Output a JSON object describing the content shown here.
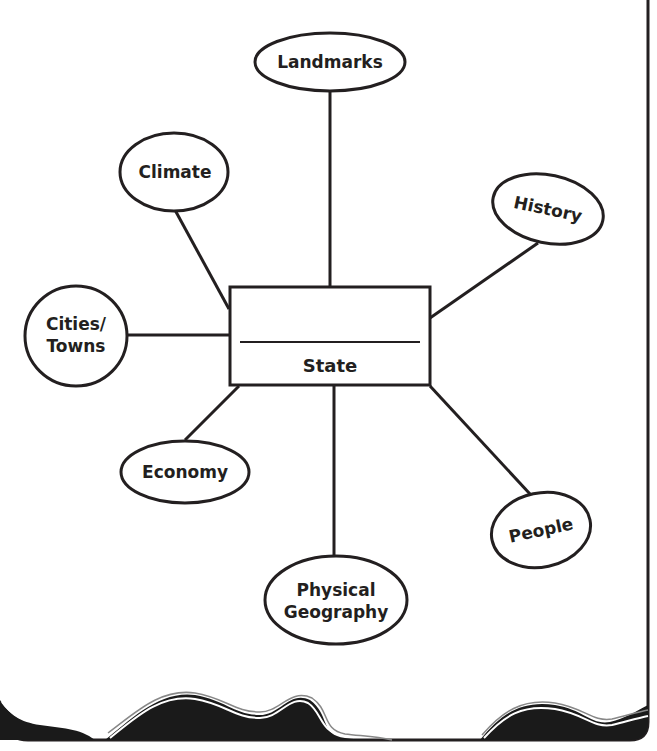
{
  "diagram": {
    "type": "concept-web",
    "colors": {
      "ink": "#231f20",
      "paper": "#ffffff"
    },
    "center": {
      "label": "State",
      "blank_line": true
    },
    "nodes": [
      {
        "id": "landmarks",
        "label": "Landmarks"
      },
      {
        "id": "climate",
        "label": "Climate"
      },
      {
        "id": "history",
        "label": "History"
      },
      {
        "id": "cities-towns",
        "label_line1": "Cities/",
        "label_line2": "Towns"
      },
      {
        "id": "economy",
        "label": "Economy"
      },
      {
        "id": "people",
        "label": "People"
      },
      {
        "id": "physical-geography",
        "label_line1": "Physical",
        "label_line2": "Geography"
      }
    ]
  }
}
